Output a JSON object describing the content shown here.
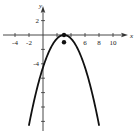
{
  "chart_data": {
    "type": "line",
    "title": "",
    "xlabel": "x",
    "ylabel": "y",
    "xlim": [
      -5,
      11.5
    ],
    "ylim": [
      -13.3,
      4.5
    ],
    "grid": false,
    "x_ticks": [
      -4,
      -2,
      0,
      2,
      4,
      6,
      8,
      10
    ],
    "x_tick_labels": [
      "-4",
      "-2",
      "6",
      "8",
      "10"
    ],
    "x_tick_label_values": [
      -4,
      -2,
      6,
      8,
      10
    ],
    "y_ticks": [
      2,
      -2,
      -4,
      -6,
      -8,
      -10,
      -12
    ],
    "y_tick_labels": [
      "2",
      "-4"
    ],
    "y_tick_label_values": [
      2,
      -4
    ],
    "series": [
      {
        "name": "parabola",
        "equation": "y = -0.5(x - 3)^2",
        "x": [
          -2,
          -1,
          0,
          1,
          2,
          3,
          4,
          5,
          6,
          7,
          8
        ],
        "values": [
          -12.5,
          -8,
          -4.5,
          -2,
          -0.5,
          0,
          -0.5,
          -2,
          -4.5,
          -8,
          -12.5
        ],
        "color": "#111111"
      }
    ],
    "points": [
      {
        "label": "vertex",
        "x": 3,
        "y": 0
      },
      {
        "label": "point",
        "x": 3,
        "y": -1
      }
    ]
  }
}
